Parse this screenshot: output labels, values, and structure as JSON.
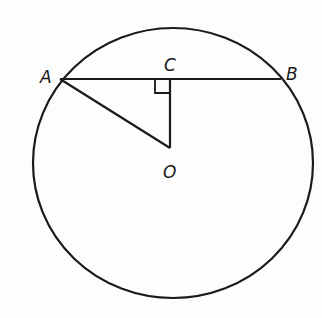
{
  "diagram": {
    "colors": {
      "stroke": "#1a1a1a",
      "background": "#fdfdfd"
    },
    "labels": {
      "A": "A",
      "B": "B",
      "C": "C",
      "O": "O"
    },
    "points": {
      "A": [
        60,
        79
      ],
      "B": [
        281,
        79
      ],
      "C": [
        170,
        79
      ],
      "O": [
        170,
        148
      ]
    },
    "circle": {
      "cx": 173,
      "cy": 163,
      "rx": 140,
      "ry": 135
    },
    "segments": [
      "AB",
      "AO",
      "CO"
    ],
    "right_angle_at": "C"
  }
}
